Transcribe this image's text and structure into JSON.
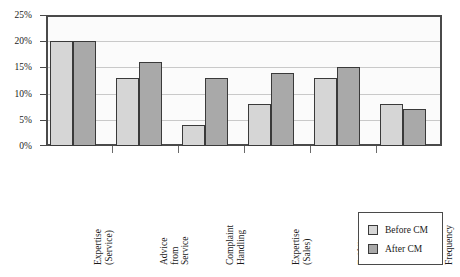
{
  "chart_data": {
    "type": "bar",
    "title": "",
    "xlabel": "",
    "ylabel": "",
    "ylim": [
      0,
      25
    ],
    "ytick_values": [
      0,
      5,
      10,
      15,
      20,
      25
    ],
    "ytick_labels": [
      "0%",
      "5%",
      "10%",
      "15%",
      "20%",
      "25%"
    ],
    "grid": true,
    "legend_position": "bottom-right",
    "categories": [
      "Expertise (Service)",
      "Advice from Service",
      "Complaint Handling",
      "Expertise (Sales)",
      "Fulfilling Promises",
      "Sales Contact Frequency"
    ],
    "category_label_lines": [
      [
        "Expertise",
        "(Service)"
      ],
      [
        "Advice",
        "from",
        "Service"
      ],
      [
        "Complaint",
        "Handling"
      ],
      [
        "Expertise",
        "(Sales)"
      ],
      [
        "Fulfilling",
        "Promises"
      ],
      [
        "Sales",
        "Contact",
        "Frequency"
      ]
    ],
    "series": [
      {
        "name": "Before CM",
        "color": "#d6d6d6",
        "values": [
          20,
          13,
          4,
          8,
          13,
          8
        ]
      },
      {
        "name": "After CM",
        "color": "#a9a9a9",
        "values": [
          20,
          16,
          13,
          14,
          15,
          7
        ]
      }
    ]
  },
  "legend": {
    "items": [
      {
        "label": "Before CM",
        "series": "before"
      },
      {
        "label": "After CM",
        "series": "after"
      }
    ]
  },
  "colors": {
    "before_cm": "#d6d6d6",
    "after_cm": "#a9a9a9",
    "axis": "#4a4a4a",
    "gridline": "#c9c9c9",
    "plot_background": "#fbfbfb"
  }
}
